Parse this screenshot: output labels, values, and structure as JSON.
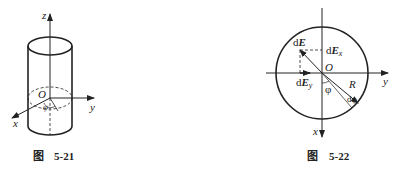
{
  "figures": [
    {
      "id": "fig-5-21",
      "caption_prefix": "图",
      "caption_number": "5-21",
      "labels": {
        "z": "z",
        "y": "y",
        "x": "x",
        "origin": "O",
        "angle": "φ"
      }
    },
    {
      "id": "fig-5-22",
      "caption_prefix": "图",
      "caption_number": "5-22",
      "labels": {
        "dE": "dE",
        "dEx": "dEx",
        "dEy": "dEy",
        "origin": "O",
        "R": "R",
        "phi": "φ",
        "dphi": "dφ",
        "x": "x",
        "y": "y"
      }
    }
  ],
  "colors": {
    "ink": "#222222",
    "background": "#ffffff"
  }
}
